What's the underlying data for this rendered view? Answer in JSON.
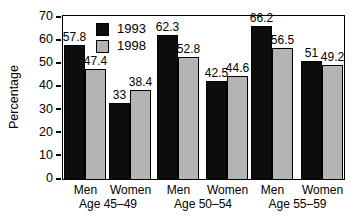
{
  "chart_data": {
    "type": "bar",
    "title": "",
    "xlabel": "",
    "ylabel": "Percentage",
    "ylim": [
      0,
      70
    ],
    "yticks": [
      "0",
      "10",
      "20",
      "30",
      "40",
      "50",
      "60",
      "70"
    ],
    "grid": "off",
    "legend_position": "top-inside-left",
    "legend": [
      {
        "label": "1993",
        "color": "#0d0d0d"
      },
      {
        "label": "1998",
        "color": "#b4b4b4"
      }
    ],
    "categories": [
      "Men Age 45–49",
      "Women Age 45–49",
      "Men Age 50–54",
      "Women Age 50–54",
      "Men Age 55–59",
      "Women Age 55–59"
    ],
    "series": [
      {
        "name": "1993",
        "values": [
          57.8,
          33,
          62.3,
          42.5,
          66.2,
          51
        ]
      },
      {
        "name": "1998",
        "values": [
          47.4,
          38.4,
          52.8,
          44.6,
          56.5,
          49.2
        ]
      }
    ],
    "value_labels": {
      "s1993": [
        "57.8",
        "33",
        "62.3",
        "42.5",
        "66.2",
        "51"
      ],
      "s1998": [
        "47.4",
        "38.4",
        "52.8",
        "44.6",
        "56.5",
        "49.2"
      ]
    },
    "groups": [
      {
        "label": "Age 45–49",
        "pairs": [
          "Men",
          "Women"
        ]
      },
      {
        "label": "Age 50–54",
        "pairs": [
          "Men",
          "Women"
        ]
      },
      {
        "label": "Age 55–59",
        "pairs": [
          "Men",
          "Women"
        ]
      }
    ]
  }
}
